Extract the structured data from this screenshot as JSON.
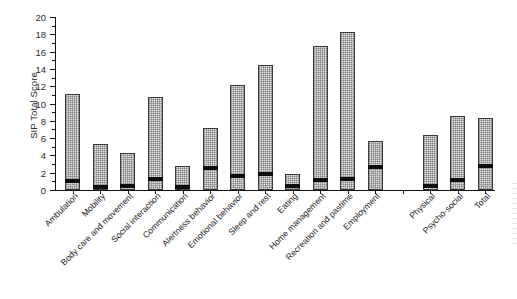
{
  "chart_data": {
    "type": "bar",
    "title": "",
    "xlabel": "",
    "ylabel": "SIP Total Score",
    "ylim": [
      0,
      20
    ],
    "ytick_step": 2,
    "yticks": [
      0,
      2,
      4,
      6,
      8,
      10,
      12,
      14,
      16,
      18,
      20
    ],
    "ytick_labels": [
      "0",
      "2",
      "4",
      "6",
      "8",
      "10",
      "12",
      "14",
      "16",
      "18",
      "20"
    ],
    "grid": false,
    "legend": null,
    "bar_style": {
      "fill": "#e2e2e2",
      "pattern": "stippled-dots",
      "edge": "#3a3a3a",
      "median_marker_color": "#0d0d0d"
    },
    "categories": [
      "Ambulation",
      "Mobility",
      "Body care and movement",
      "Social interaction",
      "Communication",
      "Alertness behavior",
      "Emotional behavior",
      "Sleep and rest",
      "Eating",
      "Home management",
      "Recreation and pastime",
      "Employment",
      "",
      "Physical",
      "Psycho-social",
      "Total"
    ],
    "series": [
      {
        "name": "Upper value (bar height)",
        "values": [
          11.1,
          5.3,
          4.3,
          10.8,
          2.8,
          7.2,
          12.1,
          14.4,
          1.8,
          16.7,
          18.3,
          5.7,
          null,
          6.4,
          8.5,
          8.3
        ]
      },
      {
        "name": "Median (black band)",
        "values": [
          0.9,
          0.2,
          0.3,
          1.2,
          0.2,
          2.4,
          1.5,
          1.7,
          0.4,
          1.1,
          1.2,
          2.6,
          null,
          0.3,
          1.0,
          2.7
        ]
      }
    ]
  },
  "axis": {
    "y_title": "SIP Total Score"
  }
}
